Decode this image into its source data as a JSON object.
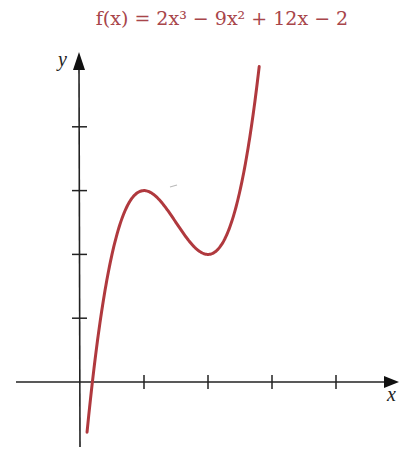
{
  "chart_data": {
    "type": "line",
    "title": "f(x) = 2x³ − 9x² + 12x − 2",
    "xlabel": "x",
    "ylabel": "y",
    "function": "2x^3 - 9x^2 + 12x - 2",
    "x_ticks": [
      1,
      2,
      3,
      4
    ],
    "y_ticks": [
      1,
      2,
      3,
      4
    ],
    "tick_labels_shown": false,
    "xlim": [
      -1,
      5
    ],
    "ylim": [
      -1.1,
      5.1
    ],
    "grid": false,
    "legend": null,
    "curve_color": "#b0393e",
    "key_points": [
      {
        "x": 0,
        "y": -2,
        "note": "y-intercept (below visible range)"
      },
      {
        "x": 1,
        "y": 3,
        "note": "local maximum"
      },
      {
        "x": 2,
        "y": 2,
        "note": "local minimum"
      }
    ],
    "series": [
      {
        "name": "f(x)",
        "x": [
          0.11,
          0.2,
          0.3,
          0.4,
          0.5,
          0.6,
          0.7,
          0.8,
          0.9,
          1.0,
          1.1,
          1.2,
          1.3,
          1.4,
          1.5,
          1.6,
          1.7,
          1.8,
          1.9,
          2.0,
          2.1,
          2.2,
          2.3,
          2.4,
          2.5,
          2.6,
          2.7,
          2.8
        ],
        "values": [
          -0.78,
          0.02,
          0.79,
          1.37,
          1.75,
          2.03,
          2.28,
          2.54,
          2.79,
          3.0,
          2.96,
          2.86,
          2.71,
          2.53,
          2.5,
          2.35,
          2.2,
          2.11,
          2.03,
          2.0,
          2.03,
          2.14,
          2.37,
          2.74,
          3.25,
          3.95,
          4.85,
          5.98
        ]
      }
    ]
  },
  "labels": {
    "title": "f(x) = 2x³ − 9x² + 12x − 2",
    "x_axis": "x",
    "y_axis": "y"
  }
}
